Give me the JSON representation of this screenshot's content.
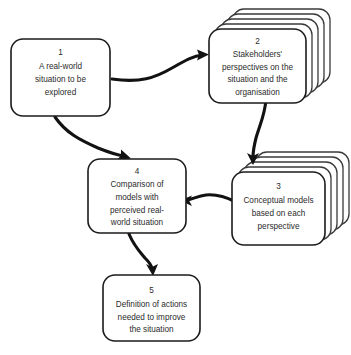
{
  "diagram": {
    "background_color": "#ffffff",
    "box_fill_color": "#ffffff",
    "box_stroke_color": "#1b1b1b",
    "text_color": "#2b2b2b",
    "arrow_color": "#121212",
    "nodes": [
      {
        "id": "node-1",
        "number": "1",
        "stacked": false,
        "stack_count": 1,
        "lines": [
          "A real-world",
          "situation to be",
          "explored"
        ]
      },
      {
        "id": "node-2",
        "number": "2",
        "stacked": true,
        "stack_count": 5,
        "lines": [
          "Stakeholders'",
          "perspectives on the",
          "situation and the",
          "organisation"
        ]
      },
      {
        "id": "node-3",
        "number": "3",
        "stacked": true,
        "stack_count": 5,
        "lines": [
          "Conceptual models",
          "based on each",
          "perspective"
        ]
      },
      {
        "id": "node-4",
        "number": "4",
        "stacked": false,
        "stack_count": 1,
        "lines": [
          "Comparison of",
          "models with",
          "perceived real-",
          "world situation"
        ]
      },
      {
        "id": "node-5",
        "number": "5",
        "stacked": false,
        "stack_count": 1,
        "lines": [
          "Definition of actions",
          "needed to improve",
          "the situation"
        ]
      }
    ],
    "edges": [
      {
        "id": "edge-1-2",
        "from": "1",
        "to": "2"
      },
      {
        "id": "edge-1-4",
        "from": "1",
        "to": "4"
      },
      {
        "id": "edge-2-3",
        "from": "2",
        "to": "3"
      },
      {
        "id": "edge-3-4",
        "from": "3",
        "to": "4"
      },
      {
        "id": "edge-4-5",
        "from": "4",
        "to": "5"
      }
    ]
  }
}
